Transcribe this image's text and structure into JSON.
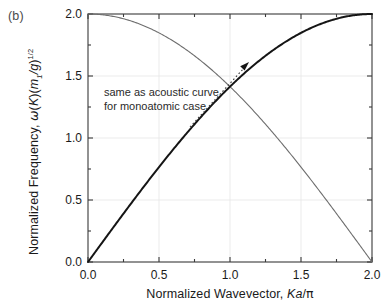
{
  "figure": {
    "panel_label": "(b)",
    "background": "#ffffff"
  },
  "annotation": {
    "line1": "same as acoustic curve",
    "line2": "for monoatomic case",
    "arrow": "dotted-arrow-pointing-to-optical-branch"
  },
  "axes": {
    "xlabel_prefix": "Normalized Wavevector, ",
    "xlabel_symbol_K": "K",
    "xlabel_symbol_a": "a",
    "xlabel_slash": "/",
    "xlabel_symbol_pi": "π",
    "ylabel_prefix": "Normalized Frequency, ",
    "ylabel_omega": "ω",
    "ylabel_openK": "(",
    "ylabel_K": "K",
    "ylabel_closeK": ")(",
    "ylabel_m": "m",
    "ylabel_m_sub": "1",
    "ylabel_div_g": "/g",
    "ylabel_close": ")",
    "ylabel_exp": "1/2",
    "x_ticks": [
      "0.0",
      "0.5",
      "1.0",
      "1.5",
      "2.0"
    ],
    "y_ticks": [
      "0.0",
      "0.5",
      "1.0",
      "1.5",
      "2.0"
    ],
    "x_tick_values": [
      0.0,
      0.5,
      1.0,
      1.5,
      2.0
    ],
    "y_tick_values": [
      0.0,
      0.5,
      1.0,
      1.5,
      2.0
    ],
    "x_minor_values": [
      0.25,
      0.75,
      1.25,
      1.75
    ],
    "y_minor_values": [
      0.25,
      0.75,
      1.25,
      1.75
    ],
    "xlim": [
      0.0,
      2.0
    ],
    "ylim": [
      0.0,
      2.0
    ],
    "frame_color": "#3a3a3a",
    "grid_color": "#e2e2e2"
  },
  "chart_data": {
    "type": "line",
    "title": "",
    "subtitle": "",
    "xlabel": "Normalized Wavevector, Ka/π",
    "ylabel": "Normalized Frequency, ω(K)(m₁/g)^(1/2)",
    "xlim": [
      0.0,
      2.0
    ],
    "ylim": [
      0.0,
      2.0
    ],
    "grid": true,
    "legend": "none",
    "annotations": [
      {
        "text": "same as acoustic curve for monoatomic case",
        "x": 0.62,
        "y": 1.28,
        "arrow_to": [
          1.15,
          1.62
        ]
      }
    ],
    "x": [
      0.0,
      0.1,
      0.2,
      0.3,
      0.4,
      0.5,
      0.6,
      0.7,
      0.8,
      0.9,
      1.0,
      1.1,
      1.2,
      1.3,
      1.4,
      1.5,
      1.6,
      1.7,
      1.8,
      1.9,
      2.0
    ],
    "series": [
      {
        "name": "optical-like branch",
        "color": "#6e6e6e",
        "width": 1.1,
        "style": "solid",
        "formula": "2*cos(pi*x/4)",
        "values": [
          2.0,
          1.994,
          1.976,
          1.945,
          1.902,
          1.848,
          1.782,
          1.705,
          1.618,
          1.521,
          1.414,
          1.299,
          1.176,
          1.045,
          0.908,
          0.765,
          0.618,
          0.466,
          0.313,
          0.157,
          0.0
        ]
      },
      {
        "name": "acoustic-like branch",
        "color": "#151515",
        "width": 2.0,
        "style": "solid",
        "formula": "2*sin(pi*x/4)",
        "values": [
          0.0,
          0.157,
          0.313,
          0.466,
          0.618,
          0.765,
          0.908,
          1.045,
          1.176,
          1.299,
          1.414,
          1.521,
          1.618,
          1.705,
          1.782,
          1.848,
          1.902,
          1.945,
          1.976,
          1.994,
          2.0
        ]
      }
    ],
    "crossing_point": [
      1.0,
      1.414
    ]
  }
}
